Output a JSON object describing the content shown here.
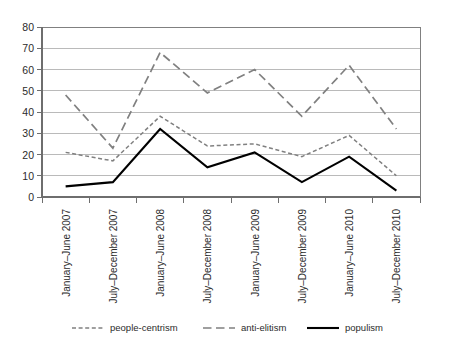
{
  "chart_data": {
    "type": "line",
    "title": "",
    "subtitle": "",
    "xlabel": "",
    "ylabel": "",
    "ylim": [
      0,
      80
    ],
    "ytick_step": 10,
    "yticks": [
      "0",
      "10",
      "20",
      "30",
      "40",
      "50",
      "60",
      "70",
      "80"
    ],
    "grid": true,
    "legend_position": "bottom",
    "categories": [
      "January–June 2007",
      "July–December 2007",
      "January–June 2008",
      "July–December 2008",
      "January–June 2009",
      "July–December 2009",
      "January–June 2010",
      "July–December 2010"
    ],
    "series": [
      {
        "name": "people-centrism",
        "style": "dashed",
        "color": "#808080",
        "values": [
          21,
          17,
          38,
          24,
          25,
          19,
          29,
          10
        ]
      },
      {
        "name": "anti-elitism",
        "style": "long-dashed",
        "color": "#808080",
        "values": [
          48,
          23,
          68,
          49,
          60,
          38,
          62,
          32
        ]
      },
      {
        "name": "populism",
        "style": "solid",
        "color": "#000000",
        "values": [
          5,
          7,
          32,
          14,
          21,
          7,
          19,
          3
        ]
      }
    ]
  },
  "legend": {
    "items": [
      {
        "label": "people-centrism",
        "swatch": "dashed-line-swatch"
      },
      {
        "label": "anti-elitism",
        "swatch": "solid-gray-line-swatch"
      },
      {
        "label": "populism",
        "swatch": "solid-black-line-swatch"
      }
    ]
  }
}
